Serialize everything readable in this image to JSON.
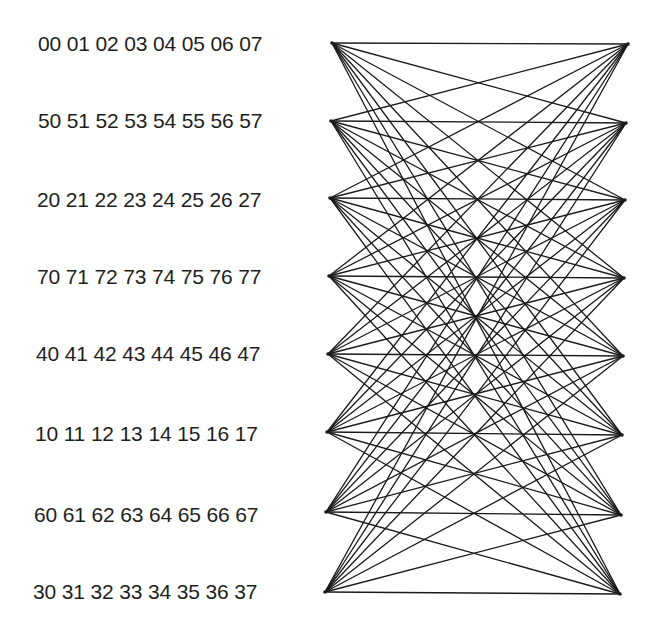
{
  "diagram": {
    "type": "complete-bipartite-graph",
    "edge_color": "#1a1a1a",
    "rows": [
      {
        "prefix": "0",
        "labels": [
          "00",
          "01",
          "02",
          "03",
          "04",
          "05",
          "06",
          "07"
        ],
        "left": [
          332,
          43
        ],
        "right": [
          628,
          44
        ],
        "text_x": 38,
        "text_y": 33
      },
      {
        "prefix": "5",
        "labels": [
          "50",
          "51",
          "52",
          "53",
          "54",
          "55",
          "56",
          "57"
        ],
        "left": [
          331,
          121
        ],
        "right": [
          626,
          123
        ],
        "text_x": 38,
        "text_y": 110
      },
      {
        "prefix": "2",
        "labels": [
          "20",
          "21",
          "22",
          "23",
          "24",
          "25",
          "26",
          "27"
        ],
        "left": [
          330,
          198
        ],
        "right": [
          625,
          200
        ],
        "text_x": 37,
        "text_y": 189
      },
      {
        "prefix": "7",
        "labels": [
          "70",
          "71",
          "72",
          "73",
          "74",
          "75",
          "76",
          "77"
        ],
        "left": [
          329,
          276
        ],
        "right": [
          624,
          278
        ],
        "text_x": 37,
        "text_y": 266
      },
      {
        "prefix": "4",
        "labels": [
          "40",
          "41",
          "42",
          "43",
          "44",
          "45",
          "46",
          "47"
        ],
        "left": [
          328,
          354
        ],
        "right": [
          623,
          356
        ],
        "text_x": 36,
        "text_y": 343
      },
      {
        "prefix": "1",
        "labels": [
          "10",
          "11",
          "12",
          "13",
          "14",
          "15",
          "16",
          "17"
        ],
        "left": [
          327,
          432
        ],
        "right": [
          622,
          435
        ],
        "text_x": 35,
        "text_y": 423
      },
      {
        "prefix": "6",
        "labels": [
          "60",
          "61",
          "62",
          "63",
          "64",
          "65",
          "66",
          "67"
        ],
        "left": [
          326,
          512
        ],
        "right": [
          621,
          515
        ],
        "text_x": 34,
        "text_y": 504
      },
      {
        "prefix": "3",
        "labels": [
          "30",
          "31",
          "32",
          "33",
          "34",
          "35",
          "36",
          "37"
        ],
        "left": [
          325,
          592
        ],
        "right": [
          620,
          594
        ],
        "text_x": 33,
        "text_y": 581
      }
    ]
  }
}
